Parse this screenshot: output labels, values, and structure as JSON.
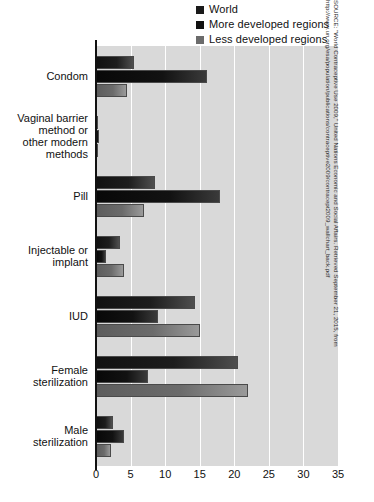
{
  "chart_data": {
    "type": "bar",
    "orientation": "horizontal",
    "title": "",
    "xlabel": "",
    "ylabel": "",
    "xlim": [
      0,
      35
    ],
    "xticks": [
      0,
      5,
      10,
      15,
      20,
      25,
      30,
      35
    ],
    "grid": true,
    "legend_position": "top-right",
    "categories": [
      "Condom",
      "Vaginal barrier method or other modern methods",
      "Pill",
      "Injectable or implant",
      "IUD",
      "Female sterilization",
      "Male sterilization"
    ],
    "series": [
      {
        "name": "World",
        "color": "#1a1a1a",
        "values": [
          5.5,
          0.3,
          8.5,
          3.5,
          14.3,
          20.5,
          2.5
        ]
      },
      {
        "name": "More developed regions",
        "color": "#111111",
        "values": [
          16.0,
          0.5,
          18.0,
          1.5,
          9.0,
          7.5,
          4.0
        ]
      },
      {
        "name": "Less developed regions",
        "color": "#6b6b6b",
        "values": [
          4.5,
          0.3,
          7.0,
          4.0,
          15.0,
          22.0,
          2.2
        ]
      }
    ],
    "source": "SOURCE: \"World Contraceptive Use 2009,\" United Nations Economic and Social Affairs. Retrieved September 21, 2015, from http://www.un.org/esa/population/publications/contraceptive2009/contracept2009_wallchart_back.pdf"
  },
  "legend": {
    "items": [
      {
        "label": "World",
        "color": "#1a1a1a"
      },
      {
        "label": "More developed regions",
        "color": "#111111"
      },
      {
        "label": "Less developed regions",
        "color": "#6b6b6b"
      }
    ]
  },
  "axis": {
    "x_tick_labels": [
      "0",
      "5",
      "10",
      "15",
      "20",
      "25",
      "30",
      "35"
    ]
  },
  "category_labels": [
    {
      "lines": [
        "Condom"
      ]
    },
    {
      "lines": [
        "Vaginal barrier",
        "method or",
        "other modern",
        "methods"
      ]
    },
    {
      "lines": [
        "Pill"
      ]
    },
    {
      "lines": [
        "Injectable or",
        "implant"
      ]
    },
    {
      "lines": [
        "IUD"
      ]
    },
    {
      "lines": [
        "Female",
        "sterilization"
      ]
    },
    {
      "lines": [
        "Male",
        "sterilization"
      ]
    }
  ],
  "source_note": "SOURCE: \"World Contraceptive Use 2009,\" United Nations Economic and Social Affairs. Retrieved September 21, 2015, from http://www.un.org/esa/population/publications/contraceptive2009/contracept2009_wallchart_back.pdf"
}
